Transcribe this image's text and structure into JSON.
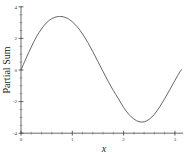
{
  "chart_data": {
    "type": "line",
    "title": "",
    "xlabel": "x",
    "ylabel": "Partial Sum",
    "xlim": [
      0,
      3.14159
    ],
    "ylim": [
      -4,
      4
    ],
    "grid": false,
    "legend": null,
    "x_ticks": [
      {
        "value": 0,
        "label": "0"
      },
      {
        "value": 1,
        "label": "1"
      },
      {
        "value": 2,
        "label": "2"
      },
      {
        "value": 3,
        "label": "3"
      }
    ],
    "y_ticks": [
      {
        "value": 4,
        "label": "4"
      },
      {
        "value": 2,
        "label": "2"
      },
      {
        "value": 0,
        "label": "0"
      },
      {
        "value": -2,
        "label": "-2"
      },
      {
        "value": -4,
        "label": "-4"
      }
    ],
    "series": [
      {
        "name": "Partial Sum",
        "color": "#555555",
        "x": [
          0,
          0.1,
          0.2,
          0.3,
          0.4,
          0.5,
          0.6,
          0.7,
          0.8,
          0.9,
          1.0,
          1.1,
          1.2,
          1.3,
          1.4,
          1.5,
          1.6,
          1.7,
          1.8,
          1.9,
          2.0,
          2.1,
          2.2,
          2.3,
          2.4,
          2.5,
          2.6,
          2.7,
          2.8,
          2.9,
          3.0,
          3.1,
          3.14159
        ],
        "y": [
          0,
          0.75,
          1.45,
          2.1,
          2.6,
          3.0,
          3.25,
          3.37,
          3.38,
          3.28,
          3.05,
          2.72,
          2.28,
          1.75,
          1.16,
          0.53,
          -0.1,
          -0.72,
          -1.3,
          -1.82,
          -2.37,
          -2.8,
          -3.1,
          -3.27,
          -3.28,
          -3.12,
          -2.8,
          -2.35,
          -1.82,
          -1.25,
          -0.66,
          -0.1,
          0.05
        ]
      }
    ]
  }
}
